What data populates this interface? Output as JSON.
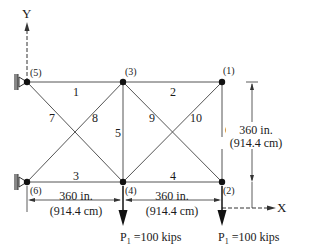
{
  "diagram": {
    "axes": {
      "x_label": "X",
      "y_label": "Y"
    },
    "nodes": [
      {
        "id": "(1)",
        "x": 222,
        "y": 82
      },
      {
        "id": "(2)",
        "x": 222,
        "y": 182
      },
      {
        "id": "(3)",
        "x": 123,
        "y": 82
      },
      {
        "id": "(4)",
        "x": 123,
        "y": 182
      },
      {
        "id": "(5)",
        "x": 27,
        "y": 82
      },
      {
        "id": "(6)",
        "x": 27,
        "y": 182
      }
    ],
    "members": [
      {
        "label": "1",
        "from": "(5)",
        "to": "(3)"
      },
      {
        "label": "2",
        "from": "(3)",
        "to": "(1)"
      },
      {
        "label": "3",
        "from": "(6)",
        "to": "(4)"
      },
      {
        "label": "4",
        "from": "(4)",
        "to": "(2)"
      },
      {
        "label": "5",
        "from": "(3)",
        "to": "(4)"
      },
      {
        "label": "6",
        "from": "(1)",
        "to": "(2)"
      },
      {
        "label": "7",
        "from": "(5)",
        "to": "(4)"
      },
      {
        "label": "8",
        "from": "(6)",
        "to": "(3)"
      },
      {
        "label": "9",
        "from": "(3)",
        "to": "(2)"
      },
      {
        "label": "10",
        "from": "(4)",
        "to": "(1)"
      }
    ],
    "dimensions": {
      "span_left": {
        "inches": "360 in.",
        "cm": "(914.4 cm)"
      },
      "span_right": {
        "inches": "360 in.",
        "cm": "(914.4 cm)"
      },
      "height": {
        "inches": "360 in.",
        "cm": "(914.4 cm)"
      }
    },
    "loads": [
      {
        "at": "(4)",
        "label_p": "P",
        "label_sub": "1",
        "label_val": " =100 kips"
      },
      {
        "at": "(2)",
        "label_p": "P",
        "label_sub": "1",
        "label_val": " =100 kips"
      }
    ]
  }
}
